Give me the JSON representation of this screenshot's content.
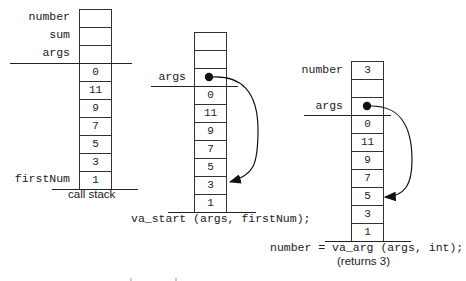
{
  "diagram": {
    "stacks": [
      {
        "id": "call-stack",
        "caption": "call stack",
        "labels": {
          "number": "number",
          "sum": "sum",
          "args": "args",
          "firstNum": "firstNum"
        },
        "cells": [
          "",
          "",
          "",
          "0",
          "11",
          "9",
          "7",
          "5",
          "3",
          "1"
        ]
      },
      {
        "id": "va-start",
        "caption": "va_start (args, firstNum);",
        "labels": {
          "args": "args"
        },
        "cells": [
          "",
          "",
          "●",
          "0",
          "11",
          "9",
          "7",
          "5",
          "3",
          "1"
        ],
        "pointer_target": "3"
      },
      {
        "id": "va-arg",
        "caption": "number = va_arg (args, int);",
        "sub_caption": "(returns 3)",
        "labels": {
          "number": "number",
          "args": "args"
        },
        "cells": [
          "3",
          "",
          "●",
          "0",
          "11",
          "9",
          "7",
          "5",
          "3",
          "1"
        ],
        "pointer_target": "5"
      }
    ]
  }
}
